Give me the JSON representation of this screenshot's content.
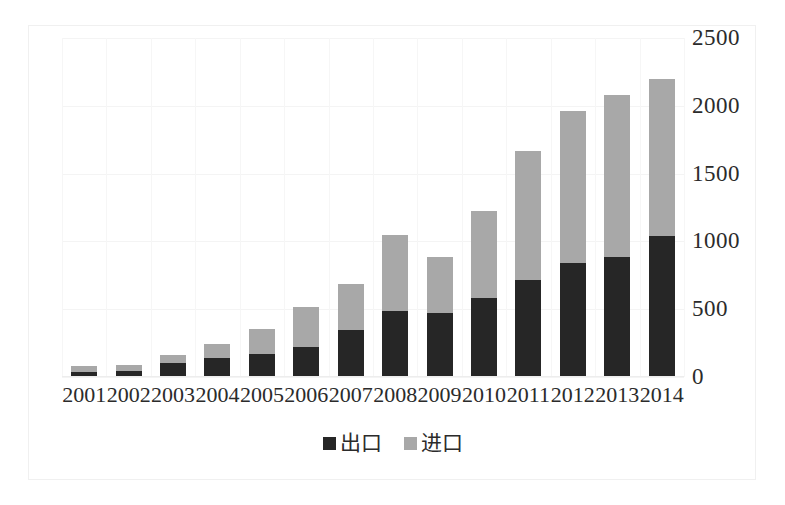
{
  "chart_data": {
    "type": "bar",
    "subtype": "stacked-vertical",
    "title": "",
    "subtitle": "",
    "xlabel": "",
    "ylabel": "",
    "ylim": [
      0,
      2500
    ],
    "ytick_step": 500,
    "ytick_labels": [
      "2500",
      "2000",
      "1500",
      "1000",
      "500",
      "0"
    ],
    "ytick_values": [
      2500,
      2000,
      1500,
      1000,
      500,
      0
    ],
    "grid": true,
    "legend_position": "bottom-center",
    "categories": [
      "2001",
      "2002",
      "2003",
      "2004",
      "2005",
      "2006",
      "2007",
      "2008",
      "2009",
      "2010",
      "2011",
      "2012",
      "2013",
      "2014"
    ],
    "series": [
      {
        "name": "出口",
        "color": "#262626",
        "values": [
          40,
          45,
          100,
          140,
          170,
          225,
          345,
          490,
          475,
          585,
          715,
          840,
          885,
          1040
        ]
      },
      {
        "name": "进口",
        "color": "#a8a8a8",
        "values": [
          40,
          45,
          60,
          105,
          185,
          290,
          340,
          560,
          410,
          640,
          955,
          1125,
          1195,
          1155
        ]
      }
    ],
    "totals": [
      80,
      90,
      160,
      245,
      355,
      515,
      685,
      1050,
      885,
      1225,
      1670,
      1965,
      2080,
      2195
    ],
    "annotations": []
  },
  "legend": {
    "items": [
      {
        "label": "出口",
        "color": "#262626",
        "swatch": "legend-swatch-dark"
      },
      {
        "label": "进口",
        "color": "#a8a8a8",
        "swatch": "legend-swatch-light"
      }
    ]
  },
  "colors": {
    "export_dark": "#262626",
    "import_light": "#a8a8a8",
    "background": "#ffffff",
    "gridline": "#f4f4f4",
    "text": "#2b2b2b",
    "frame": "#f0f0f0"
  }
}
